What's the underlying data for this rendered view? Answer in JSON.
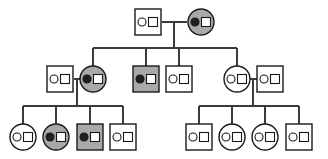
{
  "figure": {
    "background_color": "#ffffff",
    "line_color": "#3b3b3b",
    "outline_color": "#1a1a1a",
    "affected_fill": "#a9a9a9",
    "unaffected_fill": "#ffffff",
    "marker_filled_color": "#231f20",
    "marker_open_color": "#ffffff",
    "width": 328,
    "height": 159
  },
  "legend_semantics": {
    "square": "male",
    "circle": "female",
    "gray_fill": "affected individual",
    "white_fill": "unaffected individual",
    "filled_small_circle": "marker allele 1 present",
    "open_small_circle": "marker allele 1 absent",
    "open_small_square": "marker allele 2 absent"
  },
  "generations": [
    {
      "id": "generation-1",
      "label": "I",
      "individuals": [
        {
          "id": "I-1",
          "sex": "male",
          "shape": "square",
          "fill": "#ffffff",
          "circle_marker": "open",
          "square_marker": "open",
          "cx": 148,
          "cy": 22
        },
        {
          "id": "I-2",
          "sex": "female",
          "shape": "circle",
          "fill": "#a9a9a9",
          "circle_marker": "filled",
          "square_marker": "open",
          "cx": 201,
          "cy": 22
        }
      ]
    },
    {
      "id": "generation-2",
      "label": "II",
      "individuals": [
        {
          "id": "II-1",
          "sex": "male",
          "shape": "square",
          "fill": "#ffffff",
          "circle_marker": "open",
          "square_marker": "open",
          "cx": 60,
          "cy": 79
        },
        {
          "id": "II-2",
          "sex": "female",
          "shape": "circle",
          "fill": "#a9a9a9",
          "circle_marker": "filled",
          "square_marker": "open",
          "cx": 93,
          "cy": 79
        },
        {
          "id": "II-3",
          "sex": "male",
          "shape": "square",
          "fill": "#a9a9a9",
          "circle_marker": "filled",
          "square_marker": "open",
          "cx": 146,
          "cy": 79
        },
        {
          "id": "II-4",
          "sex": "male",
          "shape": "square",
          "fill": "#ffffff",
          "circle_marker": "open",
          "square_marker": "open",
          "cx": 179,
          "cy": 79
        },
        {
          "id": "II-5",
          "sex": "female",
          "shape": "circle",
          "fill": "#ffffff",
          "circle_marker": "open",
          "square_marker": "open",
          "cx": 237,
          "cy": 79
        },
        {
          "id": "II-6",
          "sex": "male",
          "shape": "square",
          "fill": "#ffffff",
          "circle_marker": "open",
          "square_marker": "open",
          "cx": 270,
          "cy": 79
        }
      ]
    },
    {
      "id": "generation-3",
      "label": "III",
      "individuals": [
        {
          "id": "III-1",
          "sex": "female",
          "shape": "circle",
          "fill": "#ffffff",
          "circle_marker": "open",
          "square_marker": "open",
          "cx": 23,
          "cy": 137
        },
        {
          "id": "III-2",
          "sex": "female",
          "shape": "circle",
          "fill": "#a9a9a9",
          "circle_marker": "filled",
          "square_marker": "open",
          "cx": 56,
          "cy": 137
        },
        {
          "id": "III-3",
          "sex": "male",
          "shape": "square",
          "fill": "#a9a9a9",
          "circle_marker": "filled",
          "square_marker": "open",
          "cx": 90,
          "cy": 137
        },
        {
          "id": "III-4",
          "sex": "male",
          "shape": "square",
          "fill": "#ffffff",
          "circle_marker": "open",
          "square_marker": "open",
          "cx": 123,
          "cy": 137
        },
        {
          "id": "III-5",
          "sex": "male",
          "shape": "square",
          "fill": "#ffffff",
          "circle_marker": "open",
          "square_marker": "open",
          "cx": 199,
          "cy": 137
        },
        {
          "id": "III-6",
          "sex": "female",
          "shape": "circle",
          "fill": "#ffffff",
          "circle_marker": "open",
          "square_marker": "open",
          "cx": 232,
          "cy": 137
        },
        {
          "id": "III-7",
          "sex": "female",
          "shape": "circle",
          "fill": "#ffffff",
          "circle_marker": "open",
          "square_marker": "open",
          "cx": 265,
          "cy": 137
        },
        {
          "id": "III-8",
          "sex": "male",
          "shape": "square",
          "fill": "#ffffff",
          "circle_marker": "open",
          "square_marker": "open",
          "cx": 299,
          "cy": 137
        }
      ]
    }
  ],
  "matings": [
    {
      "id": "mating-I",
      "partners": [
        "I-1",
        "I-2"
      ],
      "mating_line": {
        "x1": 162,
        "x2": 187,
        "y": 22
      },
      "descent_x": 174,
      "sibship_y": 48,
      "sibship_x1": 93,
      "sibship_x2": 237,
      "children": [
        "II-2",
        "II-3",
        "II-4",
        "II-5"
      ]
    },
    {
      "id": "mating-II-left",
      "partners": [
        "II-1",
        "II-2"
      ],
      "mating_line": {
        "x1": 74,
        "x2": 80,
        "y": 79
      },
      "descent_x": 77,
      "sibship_y": 106,
      "sibship_x1": 23,
      "sibship_x2": 123,
      "children": [
        "III-1",
        "III-2",
        "III-3",
        "III-4"
      ]
    },
    {
      "id": "mating-II-right",
      "partners": [
        "II-5",
        "II-6"
      ],
      "mating_line": {
        "x1": 250,
        "x2": 257,
        "y": 79
      },
      "descent_x": 253,
      "sibship_y": 106,
      "sibship_x1": 199,
      "sibship_x2": 299,
      "children": [
        "III-5",
        "III-6",
        "III-7",
        "III-8"
      ]
    }
  ],
  "geometry": {
    "square_size": 26,
    "circle_radius": 13,
    "marker_circle_radius": 4,
    "marker_square_size": 9,
    "marker_circle_offset_x": -6,
    "marker_square_offset_x": 5
  }
}
